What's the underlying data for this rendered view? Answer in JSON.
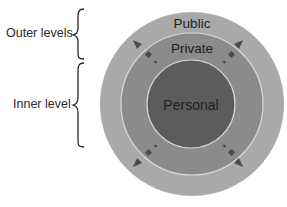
{
  "diagram": {
    "type": "concentric-circles",
    "side_labels": {
      "outer": "Outer levels",
      "inner": "Inner level"
    },
    "rings": [
      {
        "id": "public",
        "label": "Public",
        "color": "#a9a9a9"
      },
      {
        "id": "private",
        "label": "Private",
        "color": "#8b8b8b"
      },
      {
        "id": "personal",
        "label": "Personal",
        "color": "#5c5c5c"
      }
    ],
    "colors": {
      "ring_border": "#d6d6d6",
      "arrow": "#4a4a4a",
      "brace": "#2a2a2a",
      "text": "#1e1e1e"
    }
  }
}
